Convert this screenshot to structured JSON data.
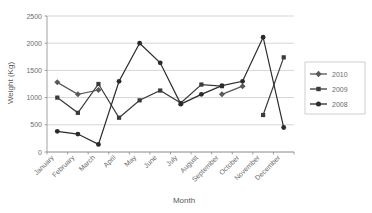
{
  "chart_data": {
    "type": "line",
    "title": "",
    "xlabel": "Month",
    "ylabel": "Weight (Kg)",
    "categories": [
      "January",
      "February",
      "March",
      "April",
      "May",
      "June",
      "July",
      "August",
      "September",
      "October",
      "November",
      "December"
    ],
    "ylim": [
      0,
      2500
    ],
    "yticks": [
      0,
      500,
      1000,
      1500,
      2000,
      2500
    ],
    "ytick_labels": [
      "0",
      "500",
      "1000",
      "1500",
      "2000",
      "2500"
    ],
    "grid": true,
    "legend_position": "right",
    "series": [
      {
        "name": "2010",
        "marker": "diamond",
        "color": "#595959",
        "values": [
          1280,
          1060,
          1140,
          null,
          null,
          null,
          null,
          null,
          1060,
          1210,
          null,
          null
        ]
      },
      {
        "name": "2009",
        "marker": "square",
        "color": "#3a3a3a",
        "values": [
          1000,
          720,
          1250,
          630,
          950,
          1130,
          900,
          1240,
          1210,
          null,
          680,
          1740
        ]
      },
      {
        "name": "2008",
        "marker": "circle",
        "color": "#2b2b2b",
        "values": [
          380,
          330,
          140,
          1300,
          2000,
          1640,
          880,
          1060,
          1220,
          1300,
          2110,
          450
        ]
      }
    ]
  },
  "axes": {
    "y_title": "Weight (Kg)",
    "x_title": "Month"
  },
  "legend": {
    "items": [
      {
        "label": "2010",
        "marker": "diamond"
      },
      {
        "label": "2009",
        "marker": "square"
      },
      {
        "label": "2008",
        "marker": "circle"
      }
    ]
  },
  "colors": {
    "series_2010": "#595959",
    "series_2009": "#3a3a3a",
    "series_2008": "#2b2b2b",
    "grid": "#b9b9b9",
    "axis": "#8a8a8a",
    "text": "#6b6b6b",
    "background": "#ffffff"
  }
}
